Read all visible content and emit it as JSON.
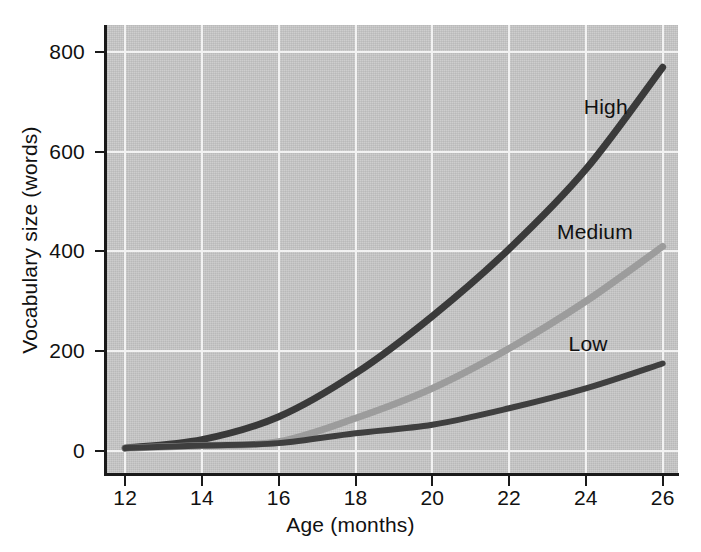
{
  "chart_data": {
    "type": "line",
    "title": "",
    "xlabel": "Age (months)",
    "ylabel": "Vocabulary size (words)",
    "x": [
      12,
      14,
      16,
      18,
      20,
      22,
      24,
      26
    ],
    "xlim": [
      11.5,
      26.4
    ],
    "ylim": [
      -45,
      855
    ],
    "xticks": [
      "12",
      "14",
      "16",
      "18",
      "20",
      "22",
      "24",
      "26"
    ],
    "yticks": [
      "0",
      "200",
      "400",
      "600",
      "800"
    ],
    "ytick_values": [
      0,
      200,
      400,
      600,
      800
    ],
    "grid": true,
    "legend_position": "inline-right-of-each-line",
    "series": [
      {
        "name": "High",
        "color": "#3a3a3a",
        "width": 7,
        "values": [
          5,
          22,
          68,
          155,
          270,
          405,
          565,
          770
        ],
        "label": "High"
      },
      {
        "name": "Medium",
        "color": "#9c9c9c",
        "width": 7,
        "values": [
          5,
          10,
          18,
          65,
          125,
          205,
          300,
          410
        ],
        "label": "Medium"
      },
      {
        "name": "Low",
        "color": "#3f3f3f",
        "width": 6,
        "values": [
          5,
          10,
          15,
          35,
          52,
          85,
          125,
          175
        ],
        "label": "Low"
      }
    ],
    "annotations": [
      {
        "text": "High",
        "x": 24.0,
        "y": 690
      },
      {
        "text": "Medium",
        "x": 23.3,
        "y": 440
      },
      {
        "text": "Low",
        "x": 23.6,
        "y": 215
      }
    ],
    "colors": {
      "panel_background": "#c9c9c9",
      "gridline": "#f2f2f2",
      "axis": "#1a1a1a",
      "text": "#111111",
      "page_background": "#ffffff"
    }
  }
}
